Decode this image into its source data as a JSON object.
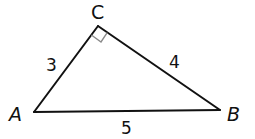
{
  "diagram": {
    "type": "right-triangle",
    "vertices": [
      {
        "id": "A",
        "label": "A",
        "x": 34,
        "y": 112
      },
      {
        "id": "B",
        "label": "B",
        "x": 220,
        "y": 110
      },
      {
        "id": "C",
        "label": "C",
        "x": 98,
        "y": 26
      }
    ],
    "sides": [
      {
        "from": "A",
        "to": "C",
        "label": "3"
      },
      {
        "from": "C",
        "to": "B",
        "label": "4"
      },
      {
        "from": "A",
        "to": "B",
        "label": "5"
      }
    ],
    "right_angle_at": "C",
    "colors": {
      "line": "#111111",
      "right_angle_mark": "#8a8a8a",
      "background": "#ffffff"
    }
  }
}
